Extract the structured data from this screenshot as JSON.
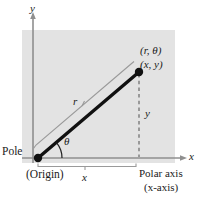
{
  "figure": {
    "type": "polar-coordinate-diagram",
    "background_color": "#ffffff",
    "panel_color": "#e3e3e3",
    "line_color": "#111111",
    "thin_line_color": "#8c8c8c",
    "dashed_line_color": "#7a7a7a"
  },
  "labels": {
    "y_axis": "y",
    "x_axis": "x",
    "point_polar": "(r, θ)",
    "point_cartesian": "(x, y)",
    "radius": "r",
    "angle": "θ",
    "vertical_leg": "y",
    "horizontal_leg": "x",
    "pole": "Pole",
    "origin": "(Origin)",
    "polar_axis": "Polar axis",
    "polar_axis_alt": "(x-axis)"
  },
  "geometry": {
    "panel": {
      "x": 22,
      "y": 30,
      "width": 153,
      "height": 133
    },
    "origin_point": {
      "x": 38,
      "y": 158
    },
    "terminal_point": {
      "x": 139,
      "y": 72
    },
    "y_axis_line": {
      "x": 33,
      "y_top": 14,
      "y_bottom": 163
    },
    "x_axis_line": {
      "y": 158,
      "x_left": 22,
      "x_right": 186
    },
    "angle_arc_radius": 24
  }
}
